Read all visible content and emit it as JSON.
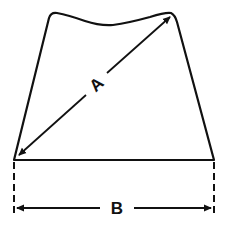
{
  "diagram": {
    "type": "dimension-diagram",
    "shape": "trapezoid-with-wavy-top",
    "colors": {
      "stroke": "#111111",
      "background": "#ffffff"
    },
    "labels": {
      "diagonal": "A",
      "base": "B"
    },
    "dimensions": [
      {
        "id": "A",
        "description": "diagonal from bottom-left corner to top-right corner",
        "arrow": "double-headed"
      },
      {
        "id": "B",
        "description": "width of base",
        "arrow": "double-headed",
        "extension_lines": "dashed"
      }
    ]
  }
}
